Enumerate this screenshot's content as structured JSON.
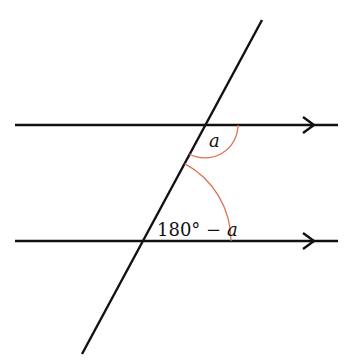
{
  "diagram": {
    "type": "parallel-lines-transversal",
    "colors": {
      "line": "#111111",
      "arc": "#e07050",
      "background": "#ffffff"
    },
    "parallel_lines": [
      {
        "id": "top",
        "y": 125,
        "x1": 15,
        "x2": 338,
        "arrow_tip_x": 314,
        "arrow_direction": "right"
      },
      {
        "id": "bottom",
        "y": 241,
        "x1": 15,
        "x2": 338,
        "arrow_tip_x": 314,
        "arrow_direction": "right"
      }
    ],
    "transversal": {
      "x1": 262,
      "y1": 20,
      "x2": 82,
      "y2": 354
    },
    "angles": [
      {
        "id": "angle-a",
        "vertex": [
          205,
          125
        ],
        "radius": 33,
        "label": "a",
        "label_italic": true
      },
      {
        "id": "angle-180-minus-a",
        "vertex": [
          143,
          241
        ],
        "radius": 88,
        "label_prefix": "180° − ",
        "label_var": "a"
      }
    ]
  },
  "labels": {
    "angle_a": "a",
    "angle_b_prefix": "180° − ",
    "angle_b_var": "a"
  }
}
